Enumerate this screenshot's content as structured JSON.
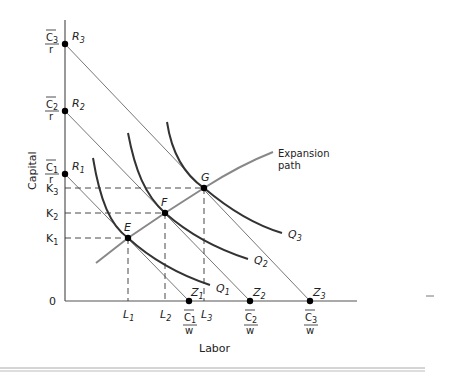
{
  "diagram": {
    "title": "",
    "axes": {
      "x_label": "Labor",
      "y_label": "Capital",
      "origin_label": "0"
    },
    "y_intercepts": [
      {
        "point": "R",
        "sub": "3",
        "num": "C",
        "num_sub": "3",
        "den": "r"
      },
      {
        "point": "R",
        "sub": "2",
        "num": "C",
        "num_sub": "2",
        "den": "r"
      },
      {
        "point": "R",
        "sub": "1",
        "num": "C",
        "num_sub": "1",
        "den": "r"
      }
    ],
    "x_intercepts": [
      {
        "point": "Z",
        "sub": "1",
        "num": "C",
        "num_sub": "1",
        "den": "w"
      },
      {
        "point": "Z",
        "sub": "2",
        "num": "C",
        "num_sub": "2",
        "den": "w"
      },
      {
        "point": "Z",
        "sub": "3",
        "num": "C",
        "num_sub": "3",
        "den": "w"
      }
    ],
    "capital_ticks": [
      {
        "base": "K",
        "sub": "3"
      },
      {
        "base": "K",
        "sub": "2"
      },
      {
        "base": "K",
        "sub": "1"
      }
    ],
    "labor_ticks": [
      {
        "base": "L",
        "sub": "1"
      },
      {
        "base": "L",
        "sub": "2"
      },
      {
        "base": "L",
        "sub": "3"
      }
    ],
    "equilibrium_points": [
      "E",
      "F",
      "G"
    ],
    "isoquants": [
      {
        "base": "Q",
        "sub": "1"
      },
      {
        "base": "Q",
        "sub": "2"
      },
      {
        "base": "Q",
        "sub": "3"
      }
    ],
    "expansion_path_label_line1": "Expansion",
    "expansion_path_label_line2": "path"
  }
}
